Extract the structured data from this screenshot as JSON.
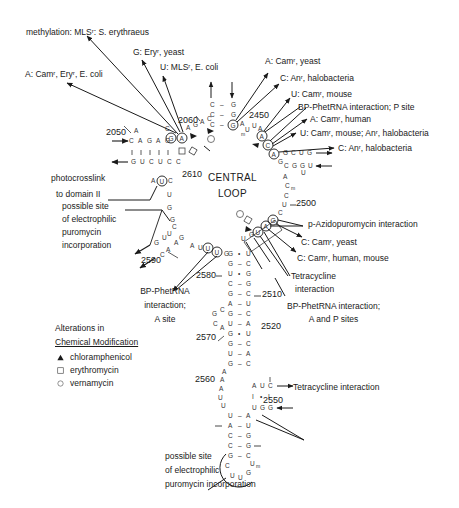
{
  "figure": {
    "center_label": [
      "CENTRAL",
      "LOOP"
    ],
    "position_numbers": {
      "n2050": "2050",
      "n2060": "2060",
      "n2450": "2450",
      "n2500": "2500",
      "n2510": "2510",
      "n2520": "2520",
      "n2550": "2550",
      "n2560": "2560",
      "n2570": "2570",
      "n2580": "2580",
      "n2590": "2590",
      "n2610": "2610"
    },
    "annotations": {
      "methylation": "methylation: MLSʳ: S. erythraeus",
      "g_ery_yeast": "G: Eryʳ, yeast",
      "u_mls_ecoli": "U: MLSʳ, E. coli",
      "a_cam_ery_ecoli": "A: Camʳ, Eryʳ, E. coli",
      "a_cam_yeast": "A: Camʳ, yeast",
      "c_an_halo_1": "C: Anʳ, halobacteria",
      "u_cam_mouse": "U: Camʳ, mouse",
      "bp_phetrna_p": "BP-PhetRNA interaction; P site",
      "a_cam_human": "A: Camʳ, human",
      "u_cam_mouse_an_halo": "U: Camʳ, mouse; Anʳ, halobacteria",
      "c_an_halo_2": "C: Anʳ, halobacteria",
      "photocrosslink": [
        "photocrosslink",
        "to domain II"
      ],
      "possible_site_1": [
        "possible site",
        "of electrophilic",
        "puromycin",
        "incorporation"
      ],
      "p_azido": "p-Azidopuromycin interaction",
      "c_cam_yeast": "C: Camʳ, yeast",
      "c_cam_human_mouse": "C: Camʳ, human, mouse",
      "tetracycline_1": [
        "Tetracycline",
        "interaction"
      ],
      "bp_phetrna_ap": [
        "BP-PhetRNA interaction;",
        "A and P sites"
      ],
      "bp_phetrna_a": [
        "BP-PhetRNA",
        "interaction;",
        "A site"
      ],
      "tetracycline_2": "Tetracycline interaction",
      "possible_site_2": [
        "possible site",
        "of electrophilic",
        "puromycin incorporation"
      ]
    },
    "legend": {
      "title_line1": "Alterations in",
      "title_line2": "Chemical Modification",
      "items": [
        {
          "symbol": "filled-triangle",
          "label": "chloramphenicol"
        },
        {
          "symbol": "open-square",
          "label": "erythromycin"
        },
        {
          "symbol": "open-circle",
          "label": "vernamycin"
        }
      ]
    }
  }
}
